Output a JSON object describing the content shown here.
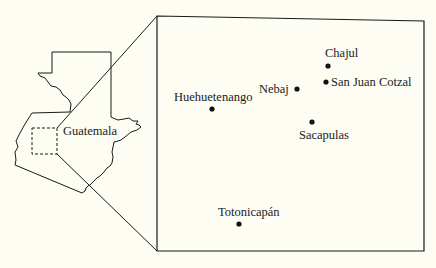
{
  "map": {
    "overview": {
      "country_label": "Guatemala"
    },
    "inset": {
      "places": [
        {
          "name": "Chajul"
        },
        {
          "name": "Nebaj"
        },
        {
          "name": "San Juan Cotzal"
        },
        {
          "name": "Huehuetenango"
        },
        {
          "name": "Sacapulas"
        },
        {
          "name": "Totonicapán"
        }
      ]
    },
    "colors": {
      "background": "#fdfdf3",
      "ink": "#1a1a1a"
    }
  }
}
